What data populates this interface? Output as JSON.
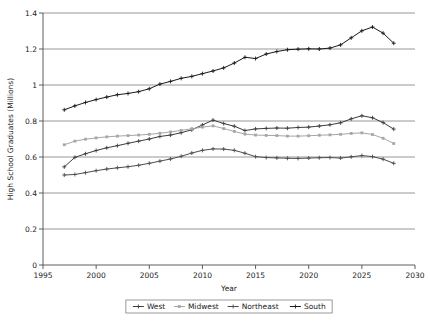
{
  "chart_data": {
    "type": "line",
    "title": "",
    "xlabel": "Year",
    "ylabel": "High School Graduates (Millions)",
    "xlim": [
      1995,
      2030
    ],
    "ylim": [
      0,
      1.4
    ],
    "xticks": [
      "1995",
      "2000",
      "2005",
      "2010",
      "2015",
      "2020",
      "2025",
      "2030"
    ],
    "yticks": [
      "0",
      "0.2",
      "0.4",
      "0.6",
      "0.8",
      "1",
      "1.2",
      "1.4"
    ],
    "grid": "horizontal",
    "legend_position": "bottom",
    "x": [
      1997,
      1998,
      1999,
      2000,
      2001,
      2002,
      2003,
      2004,
      2005,
      2006,
      2007,
      2008,
      2009,
      2010,
      2011,
      2012,
      2013,
      2014,
      2015,
      2016,
      2017,
      2018,
      2019,
      2020,
      2021,
      2022,
      2023,
      2024,
      2025,
      2026,
      2027,
      2028
    ],
    "series": [
      {
        "name": "West",
        "color": "#3d3d3d",
        "marker": "plus",
        "values": [
          0.545,
          0.598,
          0.618,
          0.636,
          0.651,
          0.663,
          0.676,
          0.688,
          0.7,
          0.714,
          0.722,
          0.735,
          0.751,
          0.778,
          0.805,
          0.786,
          0.771,
          0.747,
          0.756,
          0.759,
          0.761,
          0.76,
          0.764,
          0.766,
          0.772,
          0.779,
          0.79,
          0.812,
          0.829,
          0.818,
          0.791,
          0.755
        ]
      },
      {
        "name": "Midwest",
        "color": "#a6a6a6",
        "marker": "square",
        "values": [
          0.668,
          0.688,
          0.699,
          0.706,
          0.712,
          0.716,
          0.719,
          0.722,
          0.726,
          0.732,
          0.739,
          0.748,
          0.757,
          0.766,
          0.773,
          0.758,
          0.742,
          0.727,
          0.722,
          0.72,
          0.719,
          0.716,
          0.716,
          0.718,
          0.721,
          0.723,
          0.726,
          0.731,
          0.734,
          0.725,
          0.704,
          0.675
        ]
      },
      {
        "name": "Northeast",
        "color": "#4d4d4d",
        "marker": "plus",
        "values": [
          0.5,
          0.503,
          0.513,
          0.524,
          0.533,
          0.54,
          0.546,
          0.554,
          0.565,
          0.577,
          0.589,
          0.604,
          0.622,
          0.637,
          0.645,
          0.644,
          0.637,
          0.621,
          0.602,
          0.597,
          0.595,
          0.593,
          0.592,
          0.594,
          0.596,
          0.597,
          0.594,
          0.601,
          0.608,
          0.602,
          0.588,
          0.565
        ]
      },
      {
        "name": "South",
        "color": "#1a1a1a",
        "marker": "plus",
        "values": [
          0.862,
          0.884,
          0.903,
          0.919,
          0.933,
          0.946,
          0.953,
          0.963,
          0.979,
          1.005,
          1.02,
          1.037,
          1.048,
          1.063,
          1.078,
          1.095,
          1.122,
          1.154,
          1.147,
          1.172,
          1.186,
          1.196,
          1.199,
          1.201,
          1.2,
          1.205,
          1.223,
          1.262,
          1.301,
          1.322,
          1.288,
          1.232
        ]
      }
    ]
  },
  "legend": {
    "items": [
      {
        "label": "West"
      },
      {
        "label": "Midwest"
      },
      {
        "label": "Northeast"
      },
      {
        "label": "South"
      }
    ]
  }
}
